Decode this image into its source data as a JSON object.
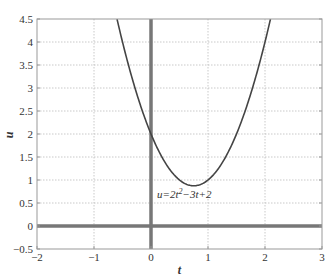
{
  "chart_data": {
    "type": "line",
    "title": "",
    "xlabel": "t",
    "ylabel": "u",
    "xlim": [
      -2,
      3
    ],
    "ylim": [
      -0.5,
      4.5
    ],
    "grid": true,
    "x_ticks": [
      -2,
      -1,
      0,
      1,
      2,
      3
    ],
    "x_tick_labels": [
      "−2",
      "−1",
      "0",
      "1",
      "2",
      "3"
    ],
    "y_ticks": [
      -0.5,
      0,
      0.5,
      1,
      1.5,
      2,
      2.5,
      3,
      3.5,
      4,
      4.5
    ],
    "y_tick_labels": [
      "−0.5",
      "0",
      "0.5",
      "1",
      "1.5",
      "2",
      "2.5",
      "3",
      "3.5",
      "4",
      "4.5"
    ],
    "series": [
      {
        "name": "u=2t^2-3t+2",
        "expression": "2*t^2 - 3*t + 2",
        "x": [
          -0.596,
          -0.5,
          -0.25,
          0,
          0.25,
          0.5,
          0.75,
          1,
          1.25,
          1.5,
          1.75,
          2,
          2.096
        ],
        "values": [
          4.5,
          4.0,
          2.875,
          2.0,
          1.375,
          1.0,
          0.875,
          1.0,
          1.375,
          2.0,
          2.875,
          4.0,
          4.5
        ]
      }
    ],
    "annotations": [
      {
        "text_main": "u=2t",
        "sup": "2",
        "text_rest": "−3t+2",
        "x": 0.1,
        "y": 0.55
      }
    ],
    "reference_lines": [
      {
        "orientation": "vertical",
        "at": 0,
        "thick": true
      },
      {
        "orientation": "horizontal",
        "at": 0,
        "thick": true
      }
    ],
    "legend": null
  },
  "colors": {
    "curve": "#444444",
    "axes_box": "#999999",
    "grid": "#bbbbbb",
    "ref_line": "#777777",
    "text": "#333333"
  }
}
